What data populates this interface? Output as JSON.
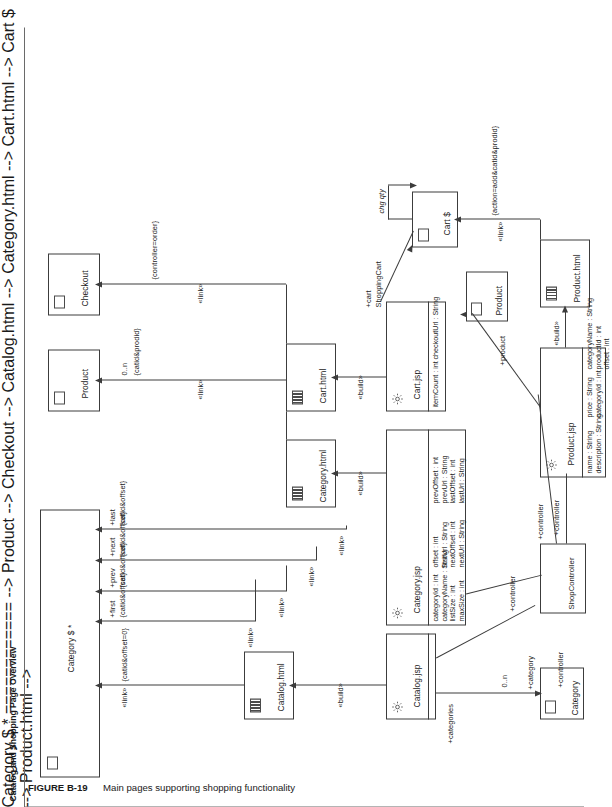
{
  "figure": {
    "number": "FIGURE B-19",
    "caption": "Main pages supporting shopping functionality",
    "diagram_title": "Catalog and Shopping Page Overview"
  },
  "nodes": {
    "catalog_jsp": {
      "name": "Catalog.jsp",
      "icon": "gear-icon"
    },
    "catalog_html": {
      "name": "Catalog.html",
      "icon": "frames-icon"
    },
    "category_jsp": {
      "name": "Category.jsp",
      "icon": "gear-icon",
      "attributes": [
        "categoryId : int",
        "categoryName : String",
        "listSize : int",
        "maxSize : int",
        "offset : int",
        "firstUrl : String",
        "nextOffset : int",
        "nextUrl : String",
        "prevOffset : int",
        "prevUrl : String",
        "lastOffset : int",
        "lastUrl : String"
      ]
    },
    "category_html": {
      "name": "Category.html",
      "icon": "frames-icon"
    },
    "category_node": {
      "name": "Category $ *",
      "icon": "page-icon"
    },
    "product_node": {
      "name": "Product",
      "icon": "page-icon"
    },
    "checkout_node": {
      "name": "Checkout",
      "icon": "page-icon"
    },
    "cart_jsp": {
      "name": "Cart.jsp",
      "icon": "gear-icon",
      "attributes": [
        "itemCount : int",
        "checkoutUrl : String"
      ]
    },
    "cart_html": {
      "name": "Cart.html",
      "icon": "frames-icon"
    },
    "cart_node": {
      "name": "Cart $",
      "icon": "page-icon"
    },
    "product_jsp": {
      "name": "Product.jsp",
      "icon": "gear-icon",
      "attributes": [
        "name : String",
        "description : String",
        "price : String",
        "categoryId : int",
        "categoryName : String",
        "productId : int",
        "offset : int"
      ]
    },
    "product_html": {
      "name": "Product.html",
      "icon": "frames-icon"
    },
    "product_small": {
      "name": "Product",
      "icon": "page-icon"
    },
    "category_small": {
      "name": "Category",
      "icon": "page-icon"
    },
    "shop_controller": {
      "name": "ShopController",
      "icon": "none"
    }
  },
  "edges": [
    {
      "id": "catalog-build",
      "stereotype": "«build»",
      "params": ""
    },
    {
      "id": "catalog-link",
      "stereotype": "«link»",
      "params": "{catid&offset=0}"
    },
    {
      "id": "category-first",
      "stereotype": "«link»",
      "role": "+first",
      "params": "{catid&offset}"
    },
    {
      "id": "category-prev",
      "stereotype": "«link»",
      "role": "+prev",
      "params": "{catid&offset}"
    },
    {
      "id": "category-next",
      "stereotype": "«link»",
      "role": "+next",
      "params": "{catid&offset}"
    },
    {
      "id": "category-last",
      "stereotype": "«link»",
      "role": "+last",
      "params": "{catid&offset}"
    },
    {
      "id": "category-build",
      "stereotype": "«build»",
      "params": ""
    },
    {
      "id": "categoryhtml-product",
      "stereotype": "«link»",
      "params": "{catid&prodid}",
      "multiplicity": "0..n"
    },
    {
      "id": "cart-build",
      "stereotype": "«build»",
      "params": ""
    },
    {
      "id": "carthtml-checkout",
      "stereotype": "«link»",
      "params": "{controller=order}"
    },
    {
      "id": "cart-cart",
      "role": "+cart",
      "params": ""
    },
    {
      "id": "shoppingcart",
      "role": "ShoppingCart",
      "params": ""
    },
    {
      "id": "cart-chgqty",
      "role": "chg qty",
      "params": ""
    },
    {
      "id": "product-build",
      "stereotype": "«build»",
      "params": ""
    },
    {
      "id": "producthtml-link",
      "stereotype": "«link»",
      "params": "{action=add&catid&prodid}"
    },
    {
      "id": "product-product",
      "role": "+product",
      "params": ""
    },
    {
      "id": "catalog-categories",
      "role": "+categories",
      "params": ""
    },
    {
      "id": "catalog-category",
      "role": "+category",
      "params": "",
      "multiplicity": "0..n"
    },
    {
      "id": "ctrl-1",
      "role": "+controller",
      "params": ""
    },
    {
      "id": "ctrl-2",
      "role": "+controller",
      "params": ""
    },
    {
      "id": "ctrl-3",
      "role": "+controller",
      "params": ""
    },
    {
      "id": "ctrl-4",
      "role": "+controller",
      "params": ""
    }
  ],
  "colors": {
    "stroke": "#3c3c3c",
    "text": "#1a1a1a",
    "page_bg": "#ffffff"
  }
}
